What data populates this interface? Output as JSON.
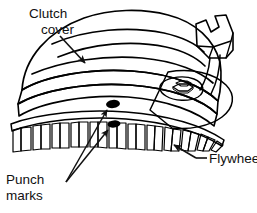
{
  "figure": {
    "background_color": "#ffffff",
    "line_color": "#000000",
    "text_color": "#111111"
  },
  "labels": {
    "clutch_cover": {
      "line1": "Clutch",
      "line2": "cover"
    },
    "punch_marks": {
      "line1": "Punch",
      "line2": "marks"
    },
    "flywheel": {
      "line1": "Flywheel"
    }
  },
  "parts": {
    "clutch_cover": {
      "name": "clutch-cover",
      "fill_light": "#ededed",
      "fill_mid": "#cfcfcf",
      "fill_shadow": "#9a9a9a"
    },
    "flywheel": {
      "name": "flywheel",
      "fill_rim": "#8f8f8f",
      "fill_tooth_face": "#b5b5b5",
      "fill_tooth_side": "#6f6f6f",
      "tooth_count": 22
    },
    "punch_marks": {
      "name": "punch-marks",
      "color": "#000000",
      "count": 2
    },
    "bolt": {
      "name": "hex-bolt",
      "fill": "#c9c9c9"
    },
    "bracket_tab": {
      "name": "bracket-tab",
      "fill": "#d6d6d6"
    }
  }
}
